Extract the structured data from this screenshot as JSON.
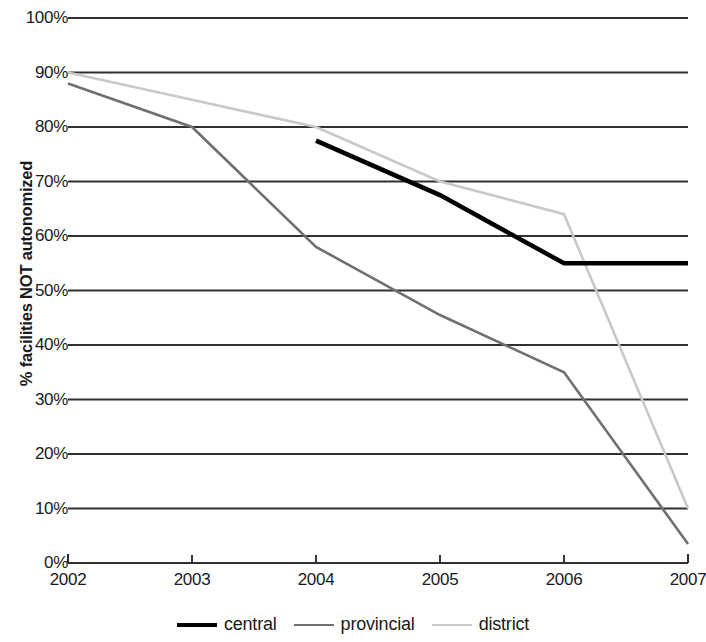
{
  "chart_data": {
    "type": "line",
    "title": "",
    "xlabel": "",
    "ylabel": "% facilities NOT autonomized",
    "x": [
      2002,
      2003,
      2004,
      2005,
      2006,
      2007
    ],
    "xtick_labels": [
      "2002",
      "2003",
      "2004",
      "2005",
      "2006",
      "2007"
    ],
    "ytick_labels": [
      "0%",
      "10%",
      "20%",
      "30%",
      "40%",
      "50%",
      "60%",
      "70%",
      "80%",
      "90%",
      "100%"
    ],
    "ytick_values": [
      0,
      10,
      20,
      30,
      40,
      50,
      60,
      70,
      80,
      90,
      100
    ],
    "xlim": [
      2002,
      2007
    ],
    "ylim": [
      0,
      100
    ],
    "grid": "horizontal",
    "legend_position": "bottom",
    "series": [
      {
        "name": "central",
        "color": "#000000",
        "width": 4.5,
        "x": [
          2004,
          2005,
          2006,
          2007
        ],
        "values": [
          77.5,
          67.5,
          55,
          55
        ]
      },
      {
        "name": "provincial",
        "color": "#707070",
        "width": 2.6,
        "x": [
          2002,
          2003,
          2004,
          2005,
          2006,
          2007
        ],
        "values": [
          88,
          80,
          58,
          45.5,
          35,
          3.5
        ]
      },
      {
        "name": "district",
        "color": "#c9c9c9",
        "width": 2.6,
        "x": [
          2002,
          2003,
          2004,
          2005,
          2006,
          2007
        ],
        "values": [
          90,
          85,
          80,
          70,
          64,
          10
        ]
      }
    ]
  },
  "legend": {
    "items": [
      {
        "label": "central",
        "color": "#000000",
        "width": 4.5
      },
      {
        "label": "provincial",
        "color": "#707070",
        "width": 2.6
      },
      {
        "label": "district",
        "color": "#c9c9c9",
        "width": 2.6
      }
    ]
  },
  "axes": {
    "gridline_color": "#303030",
    "axis_color": "#303030"
  }
}
